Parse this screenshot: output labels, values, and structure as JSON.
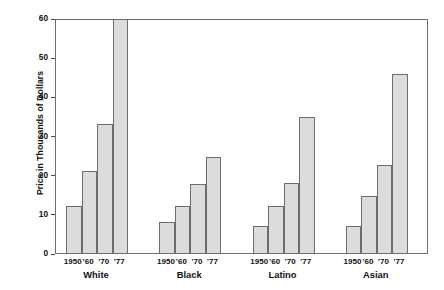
{
  "chart_data": {
    "type": "bar",
    "title": "",
    "xlabel": "",
    "ylabel": "Price in Thousands of Dollars",
    "ylim": [
      0,
      60
    ],
    "yticks": [
      0,
      10,
      20,
      30,
      40,
      50,
      60
    ],
    "ytick_labels": [
      "0",
      "10",
      "20",
      "30",
      "40",
      "50",
      "60"
    ],
    "grid": false,
    "legend": "none",
    "categories": [
      "1950",
      "'60",
      "'70",
      "'77"
    ],
    "groups": [
      "White",
      "Black",
      "Latino",
      "Asian"
    ],
    "series": [
      {
        "name": "White",
        "values": [
          12.0,
          21.0,
          33.0,
          62.0
        ]
      },
      {
        "name": "Black",
        "values": [
          8.0,
          12.0,
          17.7,
          24.6
        ]
      },
      {
        "name": "Latino",
        "values": [
          7.0,
          12.0,
          17.8,
          34.7
        ]
      },
      {
        "name": "Asian",
        "values": [
          7.0,
          14.6,
          22.5,
          45.7
        ]
      }
    ],
    "bar_fill_color": "#dcdcdc",
    "bar_border_color": "#6d6d6d",
    "axis_color": "#6e6e6e",
    "text_color": "#111111"
  }
}
